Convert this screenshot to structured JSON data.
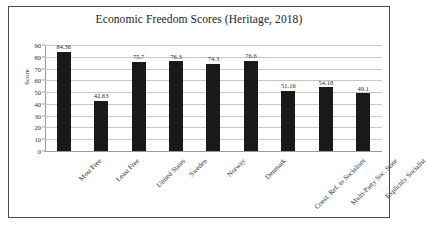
{
  "chart_data": {
    "type": "bar",
    "title": "Economic Freedom Scores (Heritage, 2018)",
    "xlabel": "",
    "ylabel": "Score",
    "ylim": [
      0,
      90
    ],
    "ytick_step": 10,
    "yticks": [
      "90",
      "80",
      "70",
      "60",
      "50",
      "40",
      "30",
      "20",
      "10",
      "0"
    ],
    "grid": true,
    "legend": "none",
    "bar_color": "#191919",
    "categories": [
      "Most Free",
      "Least Free",
      "United States",
      "Sweden",
      "Norway",
      "Denmark",
      "Const. Ref. to Socialism",
      "Multi-Party Soc. State",
      "Explicitly Socialist"
    ],
    "values": [
      84.36,
      42.63,
      75.7,
      76.3,
      74.3,
      76.6,
      51.16,
      54.18,
      49.1
    ],
    "value_labels": [
      "84.36",
      "42.63",
      "75.7",
      "76.3",
      "74.3",
      "76.6",
      "51.16",
      "54.18",
      "49.1"
    ]
  }
}
